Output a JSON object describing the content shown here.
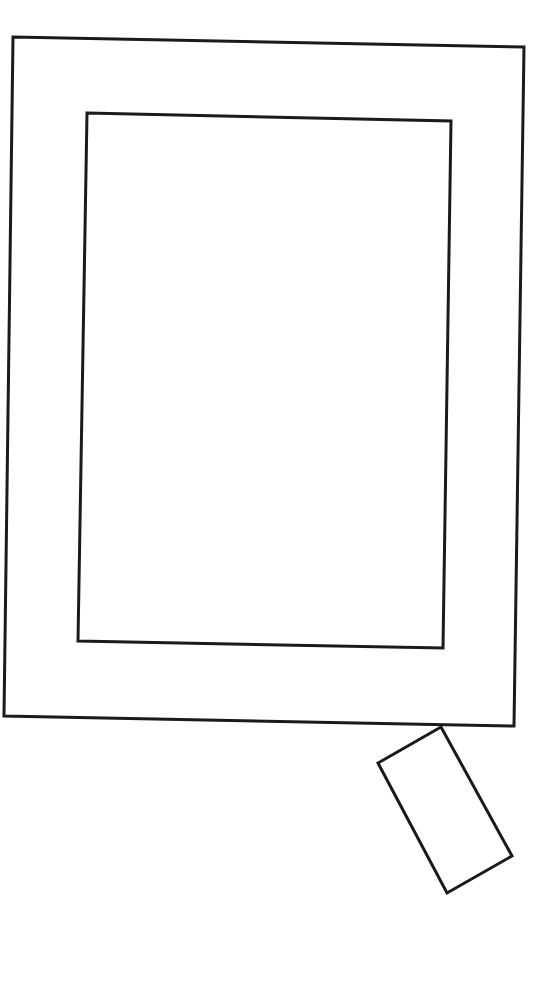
{
  "diagram": {
    "stroke_color": "#1a1a1a",
    "background_color": "#ffffff",
    "stroke_width": 3,
    "shapes": {
      "outer_frame": {
        "points": "13,37 524,47 514,726 4,716"
      },
      "inner_screen": {
        "points": "87,113 451,121 443,648 78,641"
      },
      "attached_tab": {
        "points": "441,727 512,856 447,893 378,763"
      }
    }
  }
}
